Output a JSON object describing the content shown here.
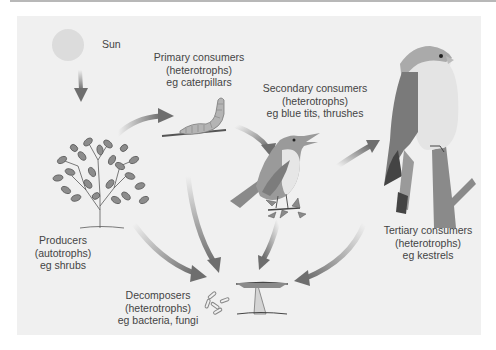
{
  "diagram": {
    "colors": {
      "panel_bg": "#f0f0f0",
      "arrow": "#6e6e6e",
      "text": "#444444",
      "sun": "#dcdcdc"
    },
    "nodes": {
      "sun": {
        "label": "Sun"
      },
      "primary": {
        "line1": "Primary consumers",
        "line2": "(heterotrophs)",
        "line3": "eg caterpillars"
      },
      "secondary": {
        "line1": "Secondary consumers",
        "line2": "(heterotrophs)",
        "line3": "eg blue tits, thrushes"
      },
      "tertiary": {
        "line1": "Tertiary consumers",
        "line2": "(heterotrophs)",
        "line3": "eg kestrels"
      },
      "producers": {
        "line1": "Producers",
        "line2": "(autotrophs)",
        "line3": "eg shrubs"
      },
      "decomposers": {
        "line1": "Decomposers",
        "line2": "(heterotrophs)",
        "line3": "eg bacteria, fungi"
      }
    },
    "edges": [
      {
        "from": "sun",
        "to": "producers"
      },
      {
        "from": "producers",
        "to": "primary"
      },
      {
        "from": "primary",
        "to": "secondary"
      },
      {
        "from": "secondary",
        "to": "tertiary"
      },
      {
        "from": "producers",
        "to": "decomposers"
      },
      {
        "from": "primary",
        "to": "decomposers"
      },
      {
        "from": "secondary",
        "to": "decomposers"
      },
      {
        "from": "tertiary",
        "to": "decomposers"
      }
    ]
  }
}
